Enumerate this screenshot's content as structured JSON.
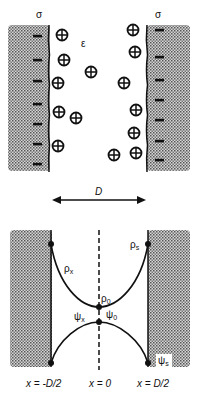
{
  "top_panel": {
    "surface_charge_label_left": "σ",
    "surface_charge_label_right": "σ",
    "dielectric_label": "ε",
    "separation_label": "D",
    "counterions": [
      {
        "x": 62,
        "y": 35
      },
      {
        "x": 64,
        "y": 60
      },
      {
        "x": 58,
        "y": 83
      },
      {
        "x": 59,
        "y": 112
      },
      {
        "x": 76,
        "y": 118
      },
      {
        "x": 58,
        "y": 146
      },
      {
        "x": 91,
        "y": 72
      },
      {
        "x": 124,
        "y": 83
      },
      {
        "x": 133,
        "y": 30
      },
      {
        "x": 135,
        "y": 52
      },
      {
        "x": 136,
        "y": 110
      },
      {
        "x": 134,
        "y": 133
      },
      {
        "x": 136,
        "y": 153
      },
      {
        "x": 114,
        "y": 155
      }
    ],
    "left_surface_charges_y": [
      36,
      60,
      81,
      104,
      124,
      144,
      164
    ],
    "right_surface_charges_y": [
      30,
      57,
      80,
      100,
      120,
      141,
      160
    ],
    "ion_symbol": "⊕",
    "surface_charge_symbol": "−"
  },
  "bottom_panel": {
    "density_profile": {
      "label_x": "ρ",
      "label_x_sub": "x",
      "label_0": "ρ",
      "label_0_sub": "0",
      "label_s": "ρ",
      "label_s_sub": "s"
    },
    "potential_profile": {
      "label_x": "ψ",
      "label_x_sub": "x",
      "label_0": "ψ",
      "label_0_sub": "0",
      "label_s": "ψ",
      "label_s_sub": "s"
    },
    "axis_labels": {
      "left": "x = -D/2",
      "center": "x = 0",
      "right": "x = D/2"
    }
  },
  "colors": {
    "ink": "#111111",
    "slab_fill": "#9a9a9a",
    "background": "#ffffff"
  }
}
